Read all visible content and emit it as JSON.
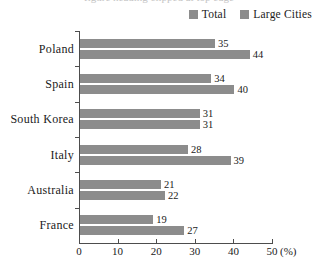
{
  "top_clipped_text": "figure heading clipped at top edge",
  "legend": {
    "position": "top-right",
    "items": [
      {
        "label": "Total",
        "color": "#8c8c8c",
        "icon": "square-swatch-icon"
      },
      {
        "label": "Large Cities",
        "color": "#8c8c8c",
        "icon": "square-swatch-icon"
      }
    ]
  },
  "axis": {
    "unit": "(%)",
    "ticks": [
      "0",
      "10",
      "20",
      "30",
      "40",
      "50"
    ]
  },
  "chart_data": {
    "type": "bar",
    "orientation": "horizontal",
    "title": "",
    "subtitle": "",
    "xlabel": "(%)",
    "ylabel": "",
    "xlim": [
      0,
      50
    ],
    "ylim": null,
    "grid": false,
    "legend_position": "top-right",
    "categories": [
      "Poland",
      "Spain",
      "South Korea",
      "Italy",
      "Australia",
      "France"
    ],
    "series": [
      {
        "name": "Total",
        "color": "#8c8c8c",
        "values": [
          35,
          34,
          31,
          28,
          21,
          19
        ]
      },
      {
        "name": "Large Cities",
        "color": "#8c8c8c",
        "values": [
          44,
          40,
          31,
          39,
          22,
          27
        ]
      }
    ],
    "tick_values": [
      0,
      10,
      20,
      30,
      40,
      50
    ],
    "tick_labels": [
      "0",
      "10",
      "20",
      "30",
      "40",
      "50"
    ],
    "annotations": [
      "Values are printed at the end of every bar",
      "South Korea has equal Total and Large Cities values (31 / 31)"
    ]
  },
  "colors": {
    "bar": "#8c8c8c",
    "axis": "#4d4d4d",
    "text": "#1a1a1a",
    "background": "#ffffff"
  }
}
